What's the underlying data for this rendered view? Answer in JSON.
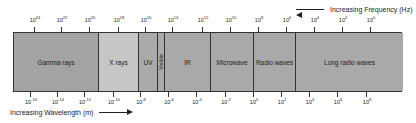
{
  "diagram": {
    "type": "electromagnetic-spectrum",
    "frequency_axis": {
      "label": "Increasing Frequency (Hz)",
      "direction": "left",
      "tick_exponents": [
        "24",
        "22",
        "20",
        "18",
        "16",
        "14",
        "12",
        "10",
        "8",
        "6",
        "4",
        "2",
        "0"
      ],
      "tick_x": [
        34,
        61,
        89,
        118,
        145,
        172,
        202,
        230,
        258,
        286,
        314,
        342,
        370
      ]
    },
    "wavelength_axis": {
      "label": "Increasing Wavelength (m)",
      "direction": "right",
      "tick_exponents": [
        "-16",
        "-14",
        "-12",
        "-10",
        "-8",
        "-6",
        "-4",
        "-2",
        "0",
        "2",
        "4",
        "6",
        "8"
      ],
      "tick_x": [
        30,
        57,
        84,
        113,
        140,
        168,
        196,
        225,
        253,
        281,
        309,
        337,
        366
      ]
    },
    "bands": [
      {
        "name": "Gamma rays",
        "width": 85,
        "color": "#a3a3a3"
      },
      {
        "name": "X rays",
        "width": 40,
        "color": "#c6c6c6"
      },
      {
        "name": "UV",
        "width": 19,
        "color": "#aaaaaa"
      },
      {
        "name": "Visible",
        "width": 7,
        "color": "#aaaaaa"
      },
      {
        "name": "IR",
        "width": 46,
        "color": "#a9a9a9"
      },
      {
        "name": "Microwave",
        "width": 43,
        "color": "#a9a9a9"
      },
      {
        "name": "Radio waves",
        "width": 42,
        "color": "#a9a9a9"
      },
      {
        "name": "Long radio waves",
        "width": 107,
        "color": "#a9a9a9"
      }
    ]
  }
}
